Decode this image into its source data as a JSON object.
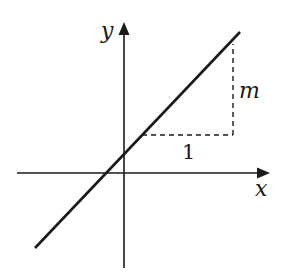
{
  "diagram": {
    "axes": {
      "x_label": "x",
      "y_label": "y"
    },
    "annotations": {
      "run_label": "1",
      "rise_label": "m"
    },
    "colors": {
      "stroke": "#1a1a1a",
      "background": "#ffffff"
    }
  }
}
